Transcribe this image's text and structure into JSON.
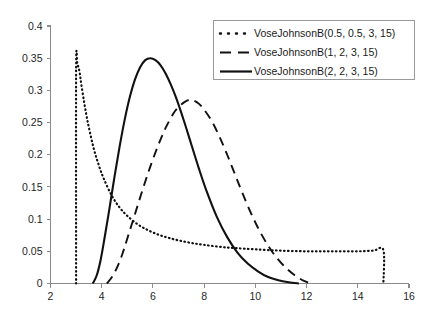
{
  "chart_data": {
    "type": "line",
    "title": "",
    "subtitle": "",
    "xlabel": "",
    "ylabel": "",
    "xlim": [
      2,
      16
    ],
    "ylim": [
      0,
      0.4
    ],
    "grid": false,
    "legend_position": "top-right",
    "x_ticks": [
      "2",
      "4",
      "6",
      "8",
      "10",
      "12",
      "14",
      "16"
    ],
    "x_tick_values": [
      2,
      4,
      6,
      8,
      10,
      12,
      14,
      16
    ],
    "y_ticks": [
      "0",
      "0.05",
      "0.1",
      "0.15",
      "0.2",
      "0.25",
      "0.3",
      "0.35",
      "0.4"
    ],
    "y_tick_values": [
      0,
      0.05,
      0.1,
      0.15,
      0.2,
      0.25,
      0.3,
      0.35,
      0.4
    ],
    "series": [
      {
        "name": "VoseJohnsonB(0.5, 0.5, 3, 15)",
        "style": "dotted",
        "color": "#111111",
        "x": [
          3.0,
          3.0,
          3.05,
          3.1,
          3.15,
          3.2,
          3.3,
          3.4,
          3.5,
          3.7,
          3.9,
          4.1,
          4.4,
          4.7,
          5.0,
          5.4,
          5.8,
          6.2,
          6.6,
          7.0,
          7.5,
          8.0,
          8.6,
          9.2,
          10.0,
          11.0,
          12.0,
          13.0,
          14.0,
          14.6,
          15.0,
          15.0
        ],
        "values": [
          0.0,
          0.335,
          0.34,
          0.335,
          0.325,
          0.31,
          0.285,
          0.262,
          0.242,
          0.208,
          0.182,
          0.161,
          0.136,
          0.118,
          0.105,
          0.092,
          0.083,
          0.076,
          0.071,
          0.067,
          0.063,
          0.06,
          0.057,
          0.055,
          0.053,
          0.051,
          0.05,
          0.05,
          0.05,
          0.051,
          0.052,
          0.0
        ]
      },
      {
        "name": "VoseJohnsonB(1, 2, 3, 15)",
        "style": "dashed",
        "color": "#111111",
        "x": [
          4.2,
          4.4,
          4.6,
          4.8,
          5.0,
          5.3,
          5.6,
          5.9,
          6.2,
          6.5,
          6.8,
          7.0,
          7.2,
          7.4,
          7.6,
          7.8,
          8.0,
          8.3,
          8.6,
          8.9,
          9.2,
          9.5,
          9.9,
          10.3,
          10.7,
          11.1,
          11.5,
          11.9,
          12.2
        ],
        "values": [
          0.0,
          0.01,
          0.025,
          0.045,
          0.07,
          0.108,
          0.146,
          0.182,
          0.214,
          0.242,
          0.264,
          0.274,
          0.281,
          0.285,
          0.284,
          0.279,
          0.27,
          0.252,
          0.228,
          0.2,
          0.17,
          0.14,
          0.103,
          0.072,
          0.047,
          0.028,
          0.014,
          0.004,
          0.0
        ]
      },
      {
        "name": "VoseJohnsonB(2, 2, 3, 15)",
        "style": "solid",
        "color": "#111111",
        "x": [
          3.65,
          3.8,
          3.95,
          4.1,
          4.3,
          4.5,
          4.7,
          4.9,
          5.1,
          5.3,
          5.5,
          5.7,
          5.9,
          6.1,
          6.3,
          6.5,
          6.7,
          6.9,
          7.2,
          7.5,
          7.8,
          8.1,
          8.5,
          8.9,
          9.3,
          9.7,
          10.1,
          10.5,
          10.9,
          11.3,
          11.7
        ],
        "values": [
          0.0,
          0.012,
          0.035,
          0.068,
          0.116,
          0.166,
          0.213,
          0.255,
          0.29,
          0.317,
          0.336,
          0.347,
          0.35,
          0.347,
          0.339,
          0.326,
          0.309,
          0.289,
          0.254,
          0.216,
          0.178,
          0.143,
          0.103,
          0.072,
          0.048,
          0.031,
          0.019,
          0.01,
          0.005,
          0.002,
          0.0
        ]
      }
    ]
  },
  "legend": {
    "entries": [
      {
        "label": "VoseJohnsonB(0.5, 0.5, 3, 15)",
        "style": "dotted"
      },
      {
        "label": "VoseJohnsonB(1, 2, 3, 15)",
        "style": "dashed"
      },
      {
        "label": "VoseJohnsonB(2, 2, 3, 15)",
        "style": "solid"
      }
    ]
  }
}
